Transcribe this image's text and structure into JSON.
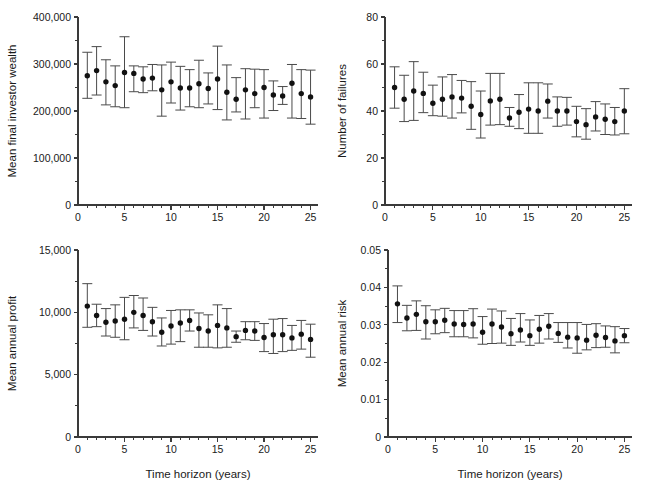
{
  "figure": {
    "width": 645,
    "height": 489,
    "background": "#ffffff",
    "marker_color": "#111111",
    "errorbar_color": "#4a4a4a",
    "axis_color": "#3a3a3a",
    "panel_count": 4
  },
  "chart_data": [
    {
      "id": "mean-final-investor-wealth",
      "type": "scatter",
      "title": "",
      "xlabel": "",
      "ylabel": "Mean final investor wealth",
      "xlim": [
        0,
        25.8
      ],
      "ylim": [
        0,
        400000
      ],
      "xticks": [
        0,
        5,
        10,
        15,
        20,
        25
      ],
      "xticklabels": [
        "0",
        "5",
        "10",
        "15",
        "20",
        "25"
      ],
      "xminorticks": [
        1,
        2,
        3,
        4,
        6,
        7,
        8,
        9,
        11,
        12,
        13,
        14,
        16,
        17,
        18,
        19,
        21,
        22,
        23,
        24
      ],
      "yticks": [
        0,
        100000,
        200000,
        300000,
        400000
      ],
      "yticklabels": [
        "0",
        "100,000",
        "200,000",
        "300,000",
        "400,000"
      ],
      "yminorticks": [
        50000,
        150000,
        250000,
        350000
      ],
      "grid": false,
      "legend": null,
      "x": [
        1,
        2,
        3,
        4,
        5,
        6,
        7,
        8,
        9,
        10,
        11,
        12,
        13,
        14,
        15,
        16,
        17,
        18,
        19,
        20,
        21,
        22,
        23,
        24,
        25
      ],
      "values": [
        275000,
        286000,
        262000,
        254000,
        282000,
        280000,
        268000,
        270000,
        245000,
        262000,
        249000,
        249000,
        258000,
        248000,
        268000,
        240000,
        225000,
        245000,
        237000,
        250000,
        234000,
        232000,
        259000,
        237000,
        230000
      ],
      "err_low": [
        227000,
        234000,
        213000,
        209000,
        207000,
        241000,
        239000,
        243000,
        189000,
        217000,
        202000,
        209000,
        207000,
        215000,
        203000,
        181000,
        198000,
        183000,
        207000,
        185000,
        201000,
        214000,
        185000,
        184000,
        172000
      ],
      "err_high": [
        325000,
        337000,
        309000,
        296000,
        358000,
        296000,
        294000,
        299000,
        298000,
        304000,
        295000,
        288000,
        308000,
        281000,
        338000,
        298000,
        271000,
        290000,
        289000,
        288000,
        264000,
        252000,
        299000,
        288000,
        287000
      ]
    },
    {
      "id": "number-of-failures",
      "type": "scatter",
      "title": "",
      "xlabel": "",
      "ylabel": "Number of failures",
      "xlim": [
        0,
        25.8
      ],
      "ylim": [
        0,
        80
      ],
      "xticks": [
        0,
        5,
        10,
        15,
        20,
        25
      ],
      "xticklabels": [
        "0",
        "5",
        "10",
        "15",
        "20",
        "25"
      ],
      "xminorticks": [
        1,
        2,
        3,
        4,
        6,
        7,
        8,
        9,
        11,
        12,
        13,
        14,
        16,
        17,
        18,
        19,
        21,
        22,
        23,
        24
      ],
      "yticks": [
        0,
        20,
        40,
        60,
        80
      ],
      "yticklabels": [
        "0",
        "20",
        "40",
        "60",
        "80"
      ],
      "yminorticks": [
        10,
        30,
        50,
        70
      ],
      "grid": false,
      "legend": null,
      "x": [
        1,
        2,
        3,
        4,
        5,
        6,
        7,
        8,
        9,
        10,
        11,
        12,
        13,
        14,
        15,
        16,
        17,
        18,
        19,
        20,
        21,
        22,
        23,
        24,
        25
      ],
      "values": [
        50.0,
        45.0,
        48.5,
        47.5,
        43.3,
        45.0,
        46.0,
        45.5,
        42.0,
        38.5,
        44.3,
        45.0,
        37.0,
        39.5,
        40.8,
        40.0,
        44.2,
        40.0,
        40.0,
        35.5,
        34.2,
        37.5,
        36.5,
        35.5,
        40.0
      ],
      "err_low": [
        41.2,
        35.5,
        36.0,
        39.3,
        38.0,
        37.8,
        37.0,
        39.2,
        32.2,
        28.5,
        34.0,
        34.2,
        33.5,
        32.5,
        30.5,
        30.5,
        37.0,
        33.5,
        34.0,
        29.0,
        28.0,
        31.5,
        30.0,
        29.8,
        30.3
      ],
      "err_high": [
        58.8,
        55.2,
        61.0,
        56.5,
        51.0,
        54.5,
        55.5,
        53.0,
        52.5,
        48.5,
        56.0,
        56.0,
        41.5,
        47.0,
        52.0,
        52.0,
        51.5,
        46.0,
        45.8,
        42.0,
        41.0,
        44.0,
        43.0,
        41.5,
        49.5
      ]
    },
    {
      "id": "mean-annual-profit",
      "type": "scatter",
      "title": "",
      "xlabel": "Time horizon (years)",
      "ylabel": "Mean annual profit",
      "xlim": [
        0,
        25.8
      ],
      "ylim": [
        0,
        15000
      ],
      "xticks": [
        0,
        5,
        10,
        15,
        20,
        25
      ],
      "xticklabels": [
        "0",
        "5",
        "10",
        "15",
        "20",
        "25"
      ],
      "xminorticks": [
        1,
        2,
        3,
        4,
        6,
        7,
        8,
        9,
        11,
        12,
        13,
        14,
        16,
        17,
        18,
        19,
        21,
        22,
        23,
        24
      ],
      "yticks": [
        0,
        5000,
        10000,
        15000
      ],
      "yticklabels": [
        "0",
        "5,000",
        "10,000",
        "15,000"
      ],
      "yminorticks": [
        2500,
        7500,
        12500
      ],
      "grid": false,
      "legend": null,
      "x": [
        1,
        2,
        3,
        4,
        5,
        6,
        7,
        8,
        9,
        10,
        11,
        12,
        13,
        14,
        15,
        16,
        17,
        18,
        19,
        20,
        21,
        22,
        23,
        24,
        25
      ],
      "values": [
        10500,
        9750,
        9200,
        9300,
        9450,
        10000,
        9750,
        9250,
        8400,
        8900,
        9150,
        9350,
        8700,
        8500,
        8950,
        8750,
        8050,
        8550,
        8500,
        7980,
        8200,
        8200,
        7950,
        8250,
        7830
      ],
      "err_low": [
        8800,
        8850,
        8100,
        8000,
        7800,
        8750,
        8550,
        8100,
        7300,
        7450,
        7650,
        8500,
        7200,
        7200,
        7150,
        7200,
        7600,
        7800,
        7750,
        6850,
        6700,
        6850,
        6950,
        7050,
        6400
      ],
      "err_high": [
        12300,
        10650,
        10300,
        10600,
        11200,
        11350,
        11150,
        10400,
        9550,
        10150,
        10200,
        10200,
        9950,
        9800,
        10600,
        10300,
        8500,
        9250,
        9250,
        9100,
        9450,
        9500,
        8950,
        9350,
        9050
      ]
    },
    {
      "id": "mean-annual-risk",
      "type": "scatter",
      "title": "",
      "xlabel": "Time horizon (years)",
      "ylabel": "Mean annual risk",
      "xlim": [
        0,
        25.8
      ],
      "ylim": [
        0,
        0.05
      ],
      "xticks": [
        0,
        5,
        10,
        15,
        20,
        25
      ],
      "xticklabels": [
        "0",
        "5",
        "10",
        "15",
        "20",
        "25"
      ],
      "xminorticks": [
        1,
        2,
        3,
        4,
        6,
        7,
        8,
        9,
        11,
        12,
        13,
        14,
        16,
        17,
        18,
        19,
        21,
        22,
        23,
        24
      ],
      "yticks": [
        0,
        0.01,
        0.02,
        0.03,
        0.04,
        0.05
      ],
      "yticklabels": [
        "0",
        "0.01",
        "0.02",
        "0.03",
        "0.04",
        "0.05"
      ],
      "yminorticks": [
        0.005,
        0.015,
        0.025,
        0.035,
        0.045
      ],
      "grid": false,
      "legend": null,
      "x": [
        1,
        2,
        3,
        4,
        5,
        6,
        7,
        8,
        9,
        10,
        11,
        12,
        13,
        14,
        15,
        16,
        17,
        18,
        19,
        20,
        21,
        22,
        23,
        24,
        25
      ],
      "values": [
        0.0356,
        0.0318,
        0.0328,
        0.0308,
        0.0308,
        0.0312,
        0.0302,
        0.0301,
        0.0302,
        0.028,
        0.0302,
        0.0294,
        0.0276,
        0.0286,
        0.0271,
        0.0288,
        0.0296,
        0.0277,
        0.0267,
        0.0265,
        0.0259,
        0.0272,
        0.0266,
        0.0257,
        0.0271
      ],
      "err_low": [
        0.0306,
        0.0284,
        0.0285,
        0.0262,
        0.0276,
        0.0279,
        0.0268,
        0.0268,
        0.0265,
        0.0248,
        0.025,
        0.0251,
        0.0245,
        0.0254,
        0.0245,
        0.0251,
        0.0262,
        0.0253,
        0.0238,
        0.0224,
        0.0233,
        0.0239,
        0.024,
        0.0225,
        0.0252
      ],
      "err_high": [
        0.0404,
        0.0352,
        0.0364,
        0.0351,
        0.034,
        0.0344,
        0.0338,
        0.0338,
        0.0343,
        0.0322,
        0.0342,
        0.0337,
        0.0317,
        0.033,
        0.0313,
        0.0325,
        0.033,
        0.0306,
        0.0306,
        0.0306,
        0.0301,
        0.0303,
        0.0297,
        0.0295,
        0.029
      ]
    }
  ],
  "panels": [
    {
      "id": "panel-top-left",
      "left": 0,
      "top": 0,
      "width": 330,
      "height": 232,
      "chart_index": 0
    },
    {
      "id": "panel-top-right",
      "left": 330,
      "top": 0,
      "width": 315,
      "height": 232,
      "chart_index": 1
    },
    {
      "id": "panel-bottom-left",
      "left": 0,
      "top": 232,
      "width": 330,
      "height": 257,
      "chart_index": 2
    },
    {
      "id": "panel-bottom-right",
      "left": 330,
      "top": 232,
      "width": 315,
      "height": 257,
      "chart_index": 3
    }
  ]
}
